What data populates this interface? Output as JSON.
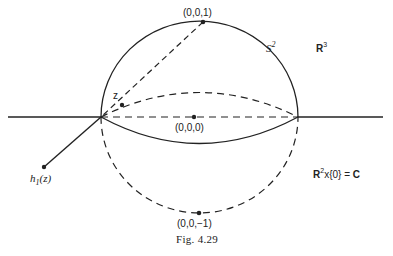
{
  "figure": {
    "caption": "Fig. 4.29",
    "labels": {
      "north_pole": "(0,0,1)",
      "origin": "(0,0,0)",
      "south_pole": "(0,0,−1)",
      "sphere": "S",
      "sphere_sup": "2",
      "space": "R",
      "space_sup": "3",
      "plane_R": "R",
      "plane_sup": "2",
      "plane_rest": "x{0} = ",
      "plane_C": "C",
      "point_z": "z",
      "image_h": "h",
      "image_sub": "1",
      "image_arg": "(z)"
    },
    "colors": {
      "ink": "#222222",
      "background": "#ffffff"
    }
  }
}
